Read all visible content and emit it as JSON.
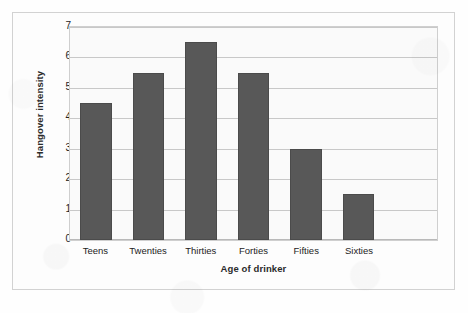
{
  "chart_data": {
    "type": "bar",
    "title": "",
    "subtitle": "",
    "categories": [
      "Teens",
      "Twenties",
      "Thirties",
      "Forties",
      "Fifties",
      "Sixties"
    ],
    "values": [
      4.5,
      5.5,
      6.5,
      5.5,
      3.0,
      1.5
    ],
    "series": [
      {
        "name": "Hangover intensity",
        "values": [
          4.5,
          5.5,
          6.5,
          5.5,
          3.0,
          1.5
        ]
      }
    ],
    "xlabel": "Age of drinker",
    "ylabel": "Hangover intensity",
    "ylim": [
      0,
      7
    ],
    "y_ticks": [
      0,
      1,
      2,
      3,
      4,
      5,
      6,
      7
    ],
    "y_tick_labels": [
      "0",
      "1",
      "2",
      "3",
      "4",
      "5",
      "6",
      "7"
    ],
    "grid": true,
    "grid_axis": "y",
    "legend": false,
    "legend_position": "none",
    "bar_color": "#585858",
    "bar_border_color": "#4b4b4b",
    "plot_background": "#fafafa",
    "gridline_color": "#c8c8c8",
    "frame_border_color": "#d2d2d2",
    "n_slots": 7,
    "annotations": []
  }
}
